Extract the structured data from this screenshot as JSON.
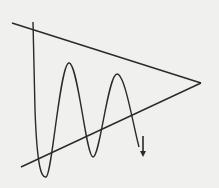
{
  "diagram": {
    "title": "",
    "type": "symmetrical-triangle-pattern",
    "colors": {
      "background": "#f0f0ef",
      "stroke": "#2a2a2a"
    },
    "upper_trendline": {
      "x1": 12,
      "y1": 23,
      "x2": 201,
      "y2": 83
    },
    "lower_trendline": {
      "x1": 21,
      "y1": 167,
      "x2": 201,
      "y2": 83
    },
    "oscillation_path": "M33,22 L35,110 C37,165 41,178 46,177 C52,176 60,63 69,63 C78,63 86,157 93,157 C100,157 108,74 117,74 C125,74 133,125 139,147",
    "breakout_arrow": {
      "x": 143,
      "y1": 136,
      "y2": 157
    }
  }
}
